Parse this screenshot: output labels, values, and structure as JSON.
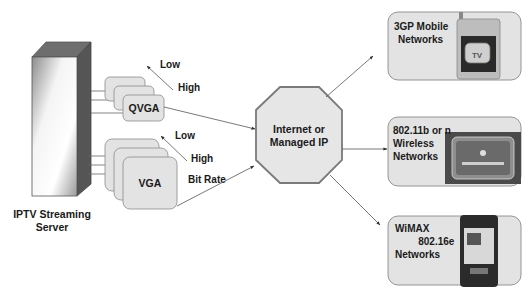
{
  "server": {
    "label_line1": "IPTV Streaming",
    "label_line2": "Server"
  },
  "streams": [
    {
      "label": "QVGA",
      "bitrate_low": "Low",
      "bitrate_high": "High"
    },
    {
      "label": "VGA",
      "bitrate_low": "Low",
      "bitrate_high": "High",
      "bitrate_caption": "Bit Rate"
    }
  ],
  "hub": {
    "label_line1": "Internet or",
    "label_line2": "Managed IP"
  },
  "networks": [
    {
      "lines": [
        "3GP Mobile",
        "Networks"
      ],
      "device_icon": "mobile-phone-tv-icon"
    },
    {
      "lines": [
        "802.11b or n",
        "Wireless",
        "Networks"
      ],
      "device_icon": "tablet-media-player-icon"
    },
    {
      "lines": [
        "WiMAX",
        " 802.16e",
        "Networks"
      ],
      "device_icon": "pda-smartphone-icon"
    }
  ],
  "colors": {
    "box_fill": "#e3e3e3",
    "box_stroke": "#8a8a8a",
    "octagon_stroke": "#7a7a7a",
    "line": "#555555",
    "text": "#1a1a1a"
  }
}
